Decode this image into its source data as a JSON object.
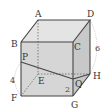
{
  "diagram": {
    "type": "cube",
    "vertices": {
      "A": {
        "label": "A",
        "x": 38,
        "y": 20
      },
      "B": {
        "label": "B",
        "x": 21,
        "y": 42
      },
      "C": {
        "label": "C",
        "x": 73,
        "y": 42
      },
      "D": {
        "label": "D",
        "x": 90,
        "y": 20
      },
      "E": {
        "label": "E",
        "x": 38,
        "y": 74
      },
      "F": {
        "label": "F",
        "x": 21,
        "y": 96
      },
      "G": {
        "label": "G",
        "x": 73,
        "y": 96
      },
      "H": {
        "label": "H",
        "x": 90,
        "y": 74
      },
      "P": {
        "label": "P",
        "x": 21,
        "y": 62
      },
      "Q": {
        "label": "Q",
        "x": 73,
        "y": 79
      }
    },
    "measurements": {
      "DH": "6",
      "PF": "4",
      "QG": "2"
    },
    "colors": {
      "edge": "#444444",
      "hidden_edge": "#666666",
      "face_front": "#d4d4d4",
      "face_top": "#e4e4e4",
      "face_right": "#c4c4c4",
      "arc": "#999999"
    }
  }
}
